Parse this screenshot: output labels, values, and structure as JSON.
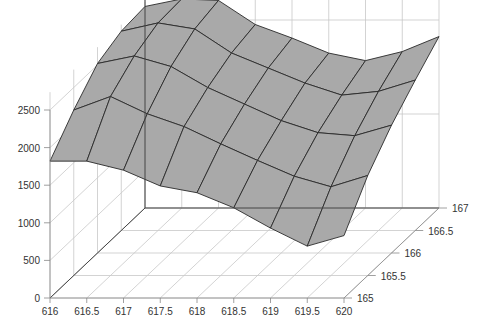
{
  "chart_data": {
    "type": "surface3d",
    "title": "",
    "xlabel": "",
    "ylabel": "",
    "zlabel": "",
    "x": [
      616,
      616.5,
      617,
      617.5,
      618,
      618.5,
      619,
      619.5,
      620
    ],
    "y": [
      165,
      165.5,
      166,
      166.5,
      167
    ],
    "x_tick_labels": [
      "616",
      "616.5",
      "617",
      "617.5",
      "618",
      "618.5",
      "619",
      "619.5",
      "620"
    ],
    "y_tick_labels": [
      "165",
      "165.5",
      "166",
      "166.5",
      "167"
    ],
    "z_tick_labels": [
      "0",
      "500",
      "1000",
      "1500",
      "2000",
      "2500"
    ],
    "z_ticks": [
      0,
      500,
      1000,
      1500,
      2000,
      2500
    ],
    "zlim": [
      0,
      3750
    ],
    "grid": true,
    "surface_color": "#a9a9a9",
    "edge_color": "#2a2a2a",
    "z": [
      [
        1820,
        1820,
        1700,
        1490,
        1400,
        1200,
        930,
        690,
        830
      ],
      [
        2200,
        2380,
        2150,
        1980,
        1750,
        1530,
        1320,
        1180,
        1330
      ],
      [
        2520,
        2620,
        2480,
        2200,
        1980,
        1760,
        1600,
        1560,
        1700
      ],
      [
        2650,
        2760,
        2680,
        2360,
        2160,
        1960,
        1800,
        1850,
        2000
      ],
      [
        2680,
        2780,
        2760,
        2440,
        2260,
        2060,
        1960,
        2080,
        2280
      ]
    ]
  },
  "projection": {
    "origin": [
      50,
      298
    ],
    "x_step": [
      36.75,
      0
    ],
    "y_step": [
      23.75,
      -22.5
    ],
    "z_per_unit": 0.0752
  }
}
